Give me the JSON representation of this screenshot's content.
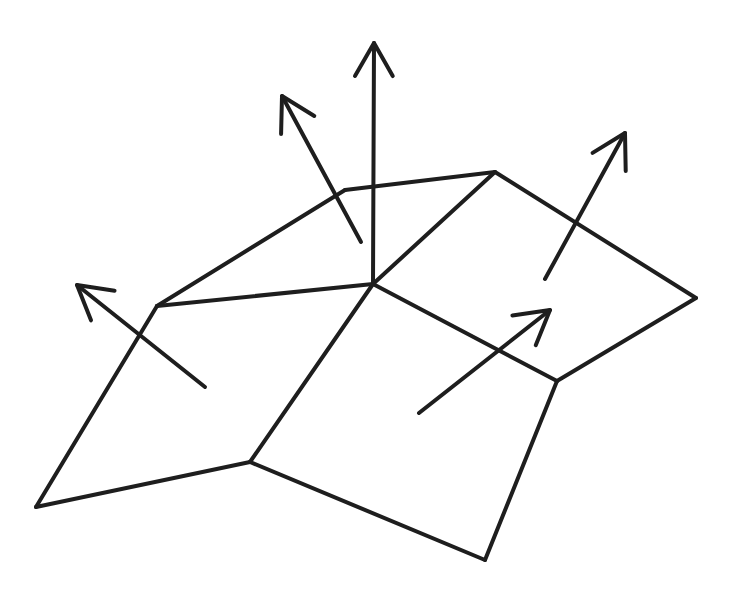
{
  "diagram": {
    "type": "polygon mesh with surface normal vectors",
    "stroke_color": "#1e1e1e",
    "background": "#ffffff",
    "vertices": {
      "A": [
        36,
        507
      ],
      "B": [
        157,
        306
      ],
      "C": [
        345,
        190
      ],
      "D": [
        495,
        172
      ],
      "E": [
        373,
        284
      ],
      "F": [
        250,
        462
      ],
      "G": [
        696,
        298
      ],
      "H": [
        557,
        381
      ],
      "I": [
        485,
        560
      ]
    },
    "edges": [
      [
        "A",
        "B"
      ],
      [
        "B",
        "C"
      ],
      [
        "C",
        "D"
      ],
      [
        "B",
        "E"
      ],
      [
        "D",
        "E"
      ],
      [
        "E",
        "F"
      ],
      [
        "A",
        "F"
      ],
      [
        "D",
        "G"
      ],
      [
        "G",
        "H"
      ],
      [
        "E",
        "H"
      ],
      [
        "H",
        "I"
      ],
      [
        "F",
        "I"
      ]
    ],
    "faces": [
      {
        "name": "top-left-face",
        "vertices": [
          "B",
          "C",
          "D",
          "E"
        ]
      },
      {
        "name": "bottom-left-face",
        "vertices": [
          "A",
          "B",
          "E",
          "F"
        ]
      },
      {
        "name": "top-right-face",
        "vertices": [
          "D",
          "G",
          "H",
          "E"
        ]
      },
      {
        "name": "bottom-right-face",
        "vertices": [
          "E",
          "H",
          "I",
          "F"
        ]
      }
    ],
    "normals": [
      {
        "name": "vertex-normal-center",
        "from": [
          373,
          284
        ],
        "to": [
          374,
          43
        ]
      },
      {
        "name": "face-normal-top-left",
        "from": [
          361,
          242
        ],
        "to": [
          282,
          96
        ]
      },
      {
        "name": "face-normal-bottom-left",
        "from": [
          205,
          387
        ],
        "to": [
          77,
          285
        ]
      },
      {
        "name": "face-normal-top-right",
        "from": [
          545,
          279
        ],
        "to": [
          625,
          133
        ]
      },
      {
        "name": "face-normal-bottom-right",
        "from": [
          419,
          413
        ],
        "to": [
          550,
          310
        ]
      }
    ]
  }
}
